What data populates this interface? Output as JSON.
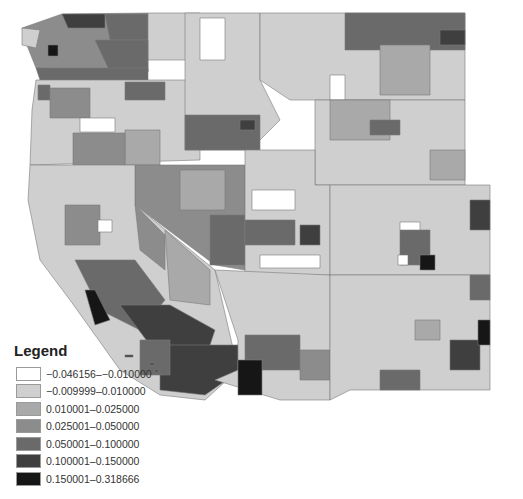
{
  "map": {
    "region": "Western United States counties",
    "legend": {
      "title": "Legend",
      "classes": [
        {
          "label": "−0.046156–−0.010000",
          "color": "#ffffff"
        },
        {
          "label": "−0.009999–0.010000",
          "color": "#cfcfcf"
        },
        {
          "label": "0.010001–0.025000",
          "color": "#a9a9a9"
        },
        {
          "label": "0.025001–0.050000",
          "color": "#8c8c8c"
        },
        {
          "label": "0.050001–0.100000",
          "color": "#6a6a6a"
        },
        {
          "label": "0.100001–0.150000",
          "color": "#3f3f3f"
        },
        {
          "label": "0.150001–0.318666",
          "color": "#161616"
        }
      ]
    }
  }
}
